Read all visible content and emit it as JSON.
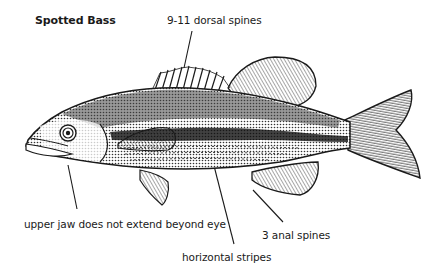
{
  "diagram": {
    "title": "Spotted Bass",
    "labels": {
      "dorsal": "9-11 dorsal spines",
      "jaw": "upper jaw does not extend beyond eye",
      "stripes": "horizontal stripes",
      "anal": "3 anal spines"
    },
    "colors": {
      "ink": "#1a1a1a",
      "background": "#ffffff",
      "shade": "#555555"
    }
  }
}
